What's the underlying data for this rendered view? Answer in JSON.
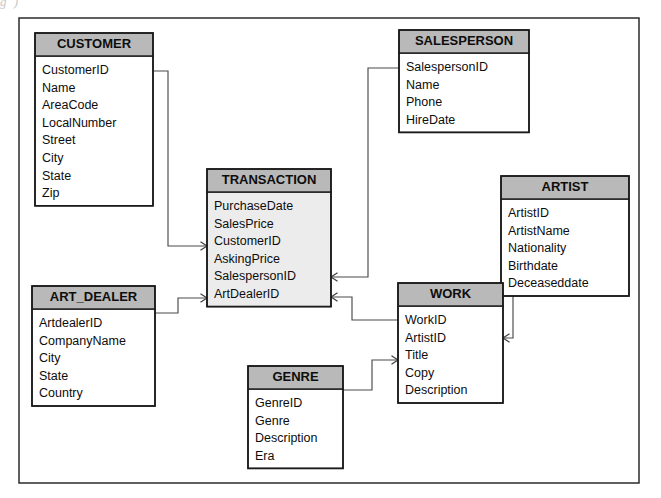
{
  "page": {
    "scan_fragment_text": "g                                                    )",
    "frame": {
      "x": 19,
      "y": 18,
      "width": 620,
      "height": 465
    }
  },
  "theme": {
    "header_fill": "#b9b9b9",
    "body_fill_plain": "#ffffff",
    "body_fill_shaded": "#ececec",
    "border_color": "#1a1a1a",
    "line_color": "#4a4a4a",
    "text_color": "#0d0d0d",
    "page_background": "#ffffff"
  },
  "diagram": {
    "type": "entity-relationship-diagram",
    "notation": "crow-foot-arrow",
    "entities": [
      {
        "id": "customer",
        "name": "CUSTOMER",
        "x": 35,
        "y": 33,
        "width": 118,
        "header_height": 23,
        "row_height": 17.6,
        "shaded": false,
        "attributes": [
          "CustomerID",
          "Name",
          "AreaCode",
          "LocalNumber",
          "Street",
          "City",
          "State",
          "Zip"
        ]
      },
      {
        "id": "salesperson",
        "name": "SALESPERSON",
        "x": 399,
        "y": 30,
        "width": 130,
        "header_height": 23,
        "row_height": 17.6,
        "shaded": false,
        "attributes": [
          "SalespersonID",
          "Name",
          "Phone",
          "HireDate"
        ]
      },
      {
        "id": "transaction",
        "name": "TRANSACTION",
        "x": 207,
        "y": 169,
        "width": 124,
        "header_height": 23,
        "row_height": 17.6,
        "shaded": true,
        "attributes": [
          "PurchaseDate",
          "SalesPrice",
          "CustomerID",
          "AskingPrice",
          "SalespersonID",
          "ArtDealerID"
        ]
      },
      {
        "id": "artist",
        "name": "ARTIST",
        "x": 501,
        "y": 176,
        "width": 128,
        "header_height": 23,
        "row_height": 17.6,
        "shaded": false,
        "attributes": [
          "ArtistID",
          "ArtistName",
          "Nationality",
          "Birthdate",
          "Deceaseddate"
        ]
      },
      {
        "id": "art_dealer",
        "name": "ART_DEALER",
        "x": 32,
        "y": 286,
        "width": 123,
        "header_height": 23,
        "row_height": 17.6,
        "shaded": false,
        "attributes": [
          "ArtdealerID",
          "CompanyName",
          "City",
          "State",
          "Country"
        ]
      },
      {
        "id": "work",
        "name": "WORK",
        "x": 398,
        "y": 283,
        "width": 105,
        "header_height": 23,
        "row_height": 17.6,
        "shaded": false,
        "attributes": [
          "WorkID",
          "ArtistID",
          "Title",
          "Copy",
          "Description"
        ]
      },
      {
        "id": "genre",
        "name": "GENRE",
        "x": 248,
        "y": 366,
        "width": 95,
        "header_height": 23,
        "row_height": 17.6,
        "shaded": false,
        "attributes": [
          "GenreID",
          "Genre",
          "Description",
          "Era"
        ]
      }
    ],
    "relationships": [
      {
        "id": "customer-transaction",
        "from_entity": "customer",
        "from_attribute": "CustomerID",
        "to_entity": "transaction",
        "to_attribute": "CustomerID",
        "path": "M 153 71 L 168 71 L 168 246 L 207 246",
        "arrow_at": {
          "x": 207,
          "y": 246,
          "direction": "right"
        }
      },
      {
        "id": "salesperson-transaction",
        "from_entity": "salesperson",
        "from_attribute": "SalespersonID",
        "to_entity": "transaction",
        "to_attribute": "SalespersonID",
        "path": "M 399 68 L 368 68 L 368 277 L 331 277",
        "arrow_at": {
          "x": 331,
          "y": 277,
          "direction": "left"
        }
      },
      {
        "id": "artdealer-transaction",
        "from_entity": "art_dealer",
        "from_attribute": "ArtdealerID",
        "to_entity": "transaction",
        "to_attribute": "ArtDealerID",
        "path": "M 155 313 L 178 313 L 178 298 L 207 298",
        "arrow_at": {
          "x": 207,
          "y": 298,
          "direction": "right"
        }
      },
      {
        "id": "transaction-work",
        "from_entity": "transaction",
        "from_attribute": "ArtDealerID",
        "to_entity": "work",
        "to_attribute": "WorkID",
        "path": "M 331 297 L 352 297 L 352 320 L 398 320",
        "arrow_at": {
          "x": 331,
          "y": 297,
          "direction": "left"
        }
      },
      {
        "id": "artist-work",
        "from_entity": "artist",
        "from_attribute": "ArtistID",
        "to_entity": "work",
        "to_attribute": "ArtistID",
        "path": "M 501 258 L 513 258 L 513 338 L 503 338",
        "arrow_at": {
          "x": 503,
          "y": 338,
          "direction": "left"
        }
      },
      {
        "id": "genre-work",
        "from_entity": "genre",
        "from_attribute": "GenreID",
        "to_entity": "work",
        "to_attribute": "Title",
        "path": "M 343 390 L 372 390 L 372 360 L 398 360",
        "arrow_at": {
          "x": 398,
          "y": 360,
          "direction": "right"
        }
      }
    ]
  }
}
